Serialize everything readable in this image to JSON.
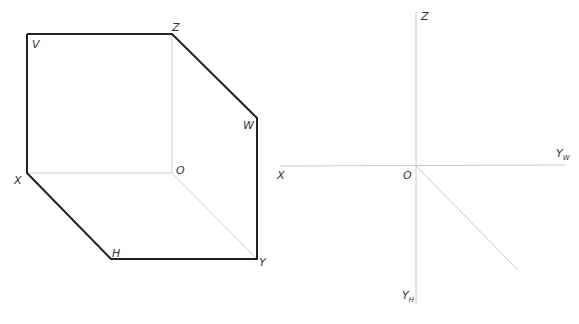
{
  "left_figure": {
    "labels": {
      "V": "V",
      "Z": "Z",
      "W": "W",
      "O": "O",
      "X": "X",
      "H": "H",
      "Y": "Y"
    }
  },
  "right_figure": {
    "labels": {
      "Z": "Z",
      "X": "X",
      "O": "O",
      "Yw": "Y",
      "Yw_sub": "W",
      "Yh": "Y",
      "Yh_sub": "H"
    }
  },
  "colors": {
    "outline": "#222222",
    "thin": "#c8c8c8"
  }
}
